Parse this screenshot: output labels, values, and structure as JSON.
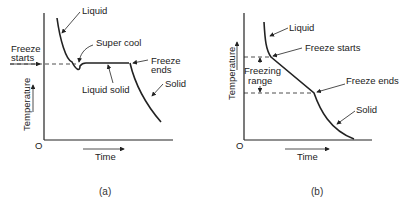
{
  "panel_a": {
    "labels": {
      "liquid": "Liquid",
      "super_cool": "Super cool",
      "freeze_starts_1": "Freeze",
      "freeze_starts_2": "starts",
      "freeze_ends_1": "Freeze",
      "freeze_ends_2": "ends",
      "liquid_solid": "Liquid solid",
      "solid": "Solid",
      "y_axis": "Temperature",
      "x_axis": "Time",
      "origin": "O"
    },
    "caption": "(a)"
  },
  "panel_b": {
    "labels": {
      "liquid": "Liquid",
      "freeze_starts": "Freeze starts",
      "freezing_range_1": "Freezing",
      "freezing_range_2": "range",
      "freeze_ends": "Freeze ends",
      "solid": "Solid",
      "y_axis": "Temperature",
      "x_axis": "Time",
      "origin": "O"
    },
    "caption": "(b)"
  },
  "colors": {
    "line": "#222222",
    "background": "#ffffff"
  }
}
